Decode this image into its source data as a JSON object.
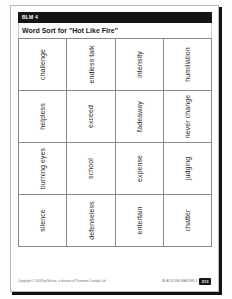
{
  "document": {
    "blm_code": "BLM 4",
    "title": "Word Sort for \"Hot Like Fire\""
  },
  "word_grid": {
    "rows": [
      {
        "cells": [
          {
            "word": "challenge"
          },
          {
            "word": "endless talk"
          },
          {
            "word": "intensity"
          },
          {
            "word": "humiliation"
          }
        ]
      },
      {
        "cells": [
          {
            "word": "helpless"
          },
          {
            "word": "exceed"
          },
          {
            "word": "fadeaway"
          },
          {
            "word": "never change"
          }
        ]
      },
      {
        "cells": [
          {
            "word": "burning eyes"
          },
          {
            "word": "school"
          },
          {
            "word": "expense"
          },
          {
            "word": "judging"
          }
        ]
      },
      {
        "cells": [
          {
            "word": "silence"
          },
          {
            "word": "defenseless"
          },
          {
            "word": "entertain"
          },
          {
            "word": "chatter"
          }
        ]
      }
    ]
  },
  "footer": {
    "copyright": "Copyright © 2008 by Nelson, a division of Thomson Canada Ltd.",
    "blackline_label": "BLACKLINE MASTER 4",
    "page_number": "213"
  },
  "colors": {
    "header_bar": "#151515",
    "grid_line": "#8a8a8a",
    "paper": "#ffffff",
    "text": "#2b2b2b"
  }
}
